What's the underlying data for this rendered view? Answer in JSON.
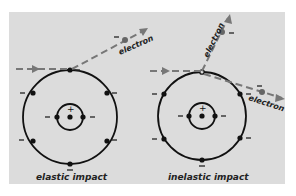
{
  "diagram": {
    "panel_color": "#dcdcdc",
    "path_color": "#777777",
    "left": {
      "caption": "elastic impact",
      "electron_label": "electron",
      "nucleus_sign": "+",
      "charge_sign": "–"
    },
    "right": {
      "caption": "inelastic impact",
      "electron_label_upper": "electron",
      "electron_label_lower": "electron",
      "nucleus_sign": "+",
      "charge_sign": "–"
    }
  }
}
